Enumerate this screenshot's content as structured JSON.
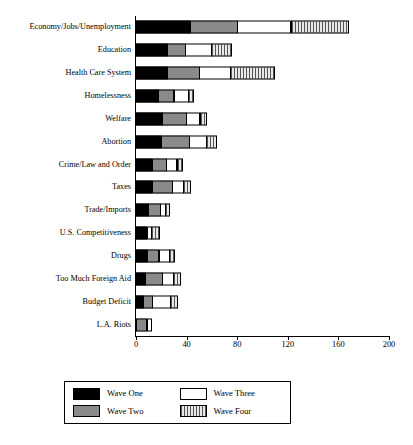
{
  "chart_data": {
    "type": "bar",
    "orientation": "horizontal",
    "stacked": true,
    "title": "",
    "xlabel": "",
    "ylabel": "",
    "xlim": [
      0,
      200
    ],
    "xticks": [
      0,
      40,
      80,
      120,
      160,
      200
    ],
    "xtick_labels": [
      "0",
      "40",
      "80",
      "120",
      "160",
      "200"
    ],
    "grid": false,
    "legend_position": "bottom",
    "categories": [
      "Economy/Jobs/Unemployment",
      "Education",
      "Health Care System",
      "Homelessness",
      "Welfare",
      "Abortion",
      "Crime/Law and Order",
      "Taxes",
      "Trade/Imports",
      "U.S. Competitiveness",
      "Drugs",
      "Too Much Foreign Aid",
      "Budget Deficit",
      "L.A. Riots"
    ],
    "series": [
      {
        "name": "Wave One",
        "color": "#000000",
        "pattern": "solid-black",
        "values": [
          43,
          25,
          25,
          18,
          21,
          20,
          13,
          13,
          10,
          9,
          9,
          8,
          6,
          0
        ]
      },
      {
        "name": "Wave Two",
        "color": "#8a8a8a",
        "pattern": "solid-gray",
        "values": [
          38,
          15,
          26,
          13,
          20,
          23,
          12,
          17,
          10,
          0,
          10,
          14,
          8,
          9
        ]
      },
      {
        "name": "Wave Three",
        "color": "#ffffff",
        "pattern": "white",
        "values": [
          43,
          21,
          25,
          12,
          11,
          14,
          9,
          9,
          5,
          4,
          9,
          9,
          15,
          4
        ]
      },
      {
        "name": "Wave Four",
        "color": "#cfcfcf",
        "pattern": "vertical-hatch",
        "values": [
          46,
          17,
          36,
          5,
          6,
          9,
          5,
          6,
          4,
          7,
          5,
          6,
          6,
          0
        ]
      }
    ],
    "totals": [
      170,
      78,
      112,
      48,
      58,
      66,
      39,
      45,
      29,
      20,
      33,
      37,
      35,
      13
    ]
  },
  "legend": {
    "items": [
      {
        "label": "Wave One",
        "swatch": "w1"
      },
      {
        "label": "Wave Three",
        "swatch": "w3"
      },
      {
        "label": "Wave Two",
        "swatch": "w2"
      },
      {
        "label": "Wave Four",
        "swatch": "w4"
      }
    ]
  }
}
